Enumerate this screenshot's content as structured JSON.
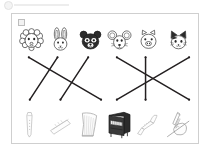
{
  "worksheet": {
    "title": "Animal and Musical Instrument Matching Worksheet",
    "top_mark_label": "page-corner-mark",
    "sheet_tag_label": "worksheet-number-box",
    "top_row_label": "animal-faces-row",
    "bottom_row_label": "musical-instruments-row",
    "line_color": "#231f20",
    "border_color": "#cfcfcf",
    "background_color": "#ffffff"
  },
  "animals": [
    {
      "id": "sheep",
      "name": "sheep-face",
      "label": "Sheep"
    },
    {
      "id": "rabbit",
      "name": "rabbit-face",
      "label": "Rabbit"
    },
    {
      "id": "bear",
      "name": "bear-face",
      "label": "Bear"
    },
    {
      "id": "mouse",
      "name": "mouse-face",
      "label": "Mouse"
    },
    {
      "id": "pig",
      "name": "pig-face",
      "label": "Pig"
    },
    {
      "id": "cat",
      "name": "cat-face",
      "label": "Cat"
    }
  ],
  "instruments": [
    {
      "id": "recorder",
      "name": "recorder-flute",
      "label": "Recorder"
    },
    {
      "id": "harmonica",
      "name": "harmonica",
      "label": "Harmonica"
    },
    {
      "id": "harp",
      "name": "harp",
      "label": "Harp"
    },
    {
      "id": "piano",
      "name": "upright-piano",
      "label": "Piano"
    },
    {
      "id": "trumpet",
      "name": "trumpet",
      "label": "Trumpet"
    },
    {
      "id": "violin",
      "name": "violin",
      "label": "Violin"
    }
  ],
  "match_lines": [
    {
      "id": "line-1",
      "from": "sheep",
      "to": "harp",
      "x1": 28,
      "y1": 57,
      "x2": 101,
      "y2": 100
    },
    {
      "id": "line-2",
      "from": "rabbit",
      "to": "recorder",
      "x1": 57,
      "y1": 57,
      "x2": 29,
      "y2": 100
    },
    {
      "id": "line-3",
      "from": "bear",
      "to": "harmonica",
      "x1": 88,
      "y1": 57,
      "x2": 60,
      "y2": 100
    },
    {
      "id": "line-4",
      "from": "mouse",
      "to": "violin",
      "x1": 117,
      "y1": 57,
      "x2": 190,
      "y2": 100
    },
    {
      "id": "line-5",
      "from": "pig",
      "to": "trumpet",
      "x1": 146,
      "y1": 57,
      "x2": 146,
      "y2": 100
    },
    {
      "id": "line-6",
      "from": "cat",
      "to": "piano",
      "x1": 190,
      "y1": 57,
      "x2": 117,
      "y2": 100
    }
  ]
}
